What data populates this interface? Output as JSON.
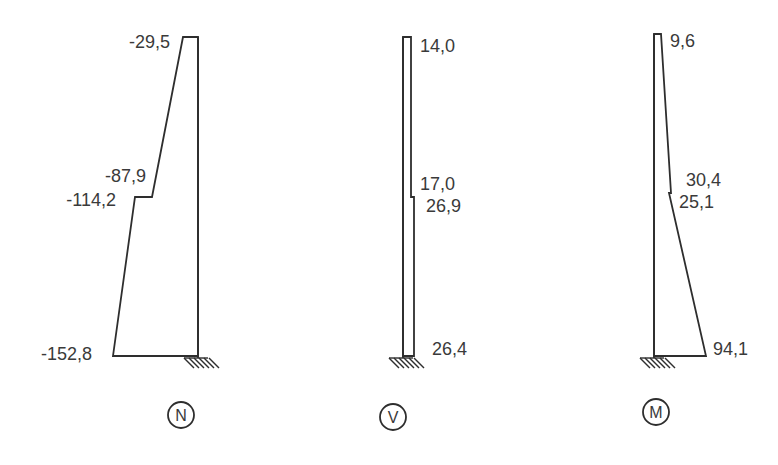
{
  "diagrams": [
    {
      "id": "N",
      "caption": "N",
      "name": "normal-force-diagram",
      "labels": {
        "top": "-29,5",
        "step_upper": "-87,9",
        "step_lower": "-114,2",
        "bottom": "-152,8"
      },
      "values": {
        "top": -29.5,
        "step_upper": -87.9,
        "step_lower": -114.2,
        "bottom": -152.8
      },
      "side": "left"
    },
    {
      "id": "V",
      "caption": "V",
      "name": "shear-force-diagram",
      "labels": {
        "top": "14,0",
        "step_upper": "17,0",
        "step_lower": "26,9",
        "bottom": "26,4"
      },
      "values": {
        "top": 14.0,
        "step_upper": 17.0,
        "step_lower": 26.9,
        "bottom": 26.4
      },
      "side": "right"
    },
    {
      "id": "M",
      "caption": "M",
      "name": "bending-moment-diagram",
      "labels": {
        "top": "9,6",
        "step_upper": "30,4",
        "step_lower": "25,1",
        "bottom": "94,1"
      },
      "values": {
        "top": 9.6,
        "step_upper": 30.4,
        "step_lower": 25.1,
        "bottom": 94.1
      },
      "side": "right"
    }
  ]
}
